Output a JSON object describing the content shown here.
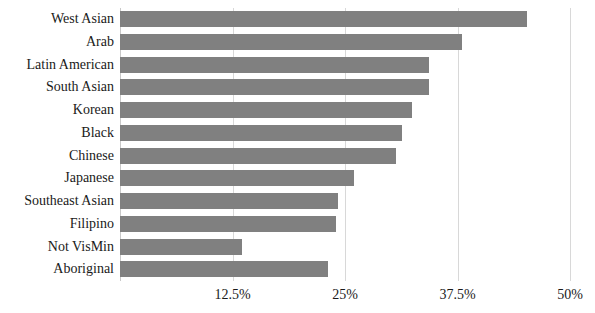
{
  "chart_data": {
    "type": "bar",
    "orientation": "horizontal",
    "title": "",
    "subtitle": "",
    "xlabel": "",
    "ylabel": "",
    "xlim": [
      0,
      50
    ],
    "ylim": null,
    "grid": true,
    "legend": null,
    "legend_position": "none",
    "bar_color": "#808080",
    "gridline_color": "#d8d8d8",
    "axis_color": "#c9c9c9",
    "xticks": [
      12.5,
      25,
      37.5,
      50
    ],
    "xticklabels": [
      "12.5%",
      "25%",
      "37.5%",
      "50%"
    ],
    "categories": [
      "West Asian",
      "Arab",
      "Latin American",
      "South Asian",
      "Korean",
      "Black",
      "Chinese",
      "Japanese",
      "Southeast Asian",
      "Filipino",
      "Not VisMin",
      "Aboriginal"
    ],
    "values": [
      45.2,
      38.0,
      34.3,
      34.3,
      32.4,
      31.3,
      30.7,
      26.0,
      24.2,
      24.0,
      13.6,
      23.1
    ]
  }
}
